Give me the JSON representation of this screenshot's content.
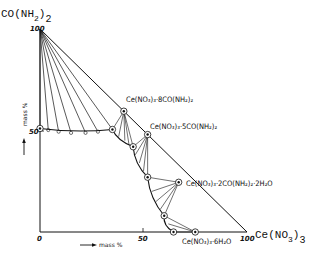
{
  "diagram": {
    "type": "ternary-phase-diagram",
    "title_component_top": {
      "main": "CO(NH",
      "sub": "2",
      "close": ")",
      "sub2": "2"
    },
    "component_right": {
      "main": "Ce(NO",
      "sub": "3",
      "close": ")",
      "sub2": "3"
    },
    "axis_labels": {
      "vertical": "mass %",
      "horizontal": "mass %"
    },
    "ticks": {
      "origin": "0",
      "y_50": "50",
      "y_100": "100",
      "x_50": "50",
      "x_100": "100"
    },
    "compound_labels": [
      {
        "id": "ce-8urea",
        "text": "Ce(NO₃)₃·8CO(NH₂)₂"
      },
      {
        "id": "ce-5urea",
        "text": "Ce(NO₃)₃·5CO(NH₂)₂"
      },
      {
        "id": "ce-2urea-2h2o",
        "text": "Ce(NO₃)₃·2CO(NH₂)₂·2H₂O"
      },
      {
        "id": "ce-6h2o",
        "text": "Ce(NO₃)₃·6H₂O"
      }
    ],
    "solid_phases": [
      {
        "name": "CO(NH2)2",
        "ce_pct": 0,
        "urea_pct": 100
      },
      {
        "name": "Ce(NO3)3·8CO(NH2)2",
        "ce_pct": 40.5,
        "urea_pct": 59.5
      },
      {
        "name": "Ce(NO3)3·5CO(NH2)2",
        "ce_pct": 52,
        "urea_pct": 48
      },
      {
        "name": "Ce(NO3)3·2CO(NH2)2·2H2O",
        "ce_pct": 67,
        "urea_pct": 24.5
      },
      {
        "name": "Ce(NO3)3·6H2O",
        "ce_pct": 75,
        "urea_pct": 0
      },
      {
        "name": "Ce(NO3)3",
        "ce_pct": 100,
        "urea_pct": 0
      }
    ],
    "invariant_points": [
      {
        "ce_pct": 0,
        "urea_pct": 51
      },
      {
        "ce_pct": 35,
        "urea_pct": 50.5
      },
      {
        "ce_pct": 45,
        "urea_pct": 42
      },
      {
        "ce_pct": 52,
        "urea_pct": 27
      },
      {
        "ce_pct": 60,
        "urea_pct": 8
      },
      {
        "ce_pct": 64.5,
        "urea_pct": 0
      }
    ]
  }
}
